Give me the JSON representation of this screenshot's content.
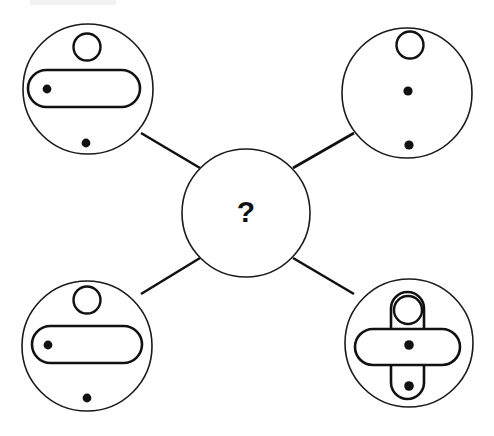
{
  "page": {
    "background_color": "#ffffff",
    "ink_color": "#111111",
    "width": 494,
    "height": 436
  },
  "center": {
    "name": "center-unknown-node",
    "label": "?",
    "cx": 246,
    "cy": 213,
    "r": 64
  },
  "connectors": [
    {
      "name": "connector-top-left",
      "x1": 141,
      "y1": 133,
      "x2": 200,
      "y2": 168
    },
    {
      "name": "connector-top-right",
      "x1": 293,
      "y1": 168,
      "x2": 354,
      "y2": 133
    },
    {
      "name": "connector-bottom-left",
      "x1": 200,
      "y1": 258,
      "x2": 141,
      "y2": 294
    },
    {
      "name": "connector-bottom-right",
      "x1": 293,
      "y1": 258,
      "x2": 354,
      "y2": 294
    }
  ],
  "nodes": [
    {
      "name": "node-top-left",
      "position": "top-left",
      "circle": {
        "cx": 88,
        "cy": 89,
        "r": 65
      },
      "shapes": [
        {
          "kind": "small-circle",
          "name": "small-circle-top",
          "cx": 87,
          "cy": 47,
          "r": 13.5
        },
        {
          "kind": "pill-horizontal",
          "name": "horizontal-pill",
          "x": 28,
          "y": 70,
          "w": 112,
          "h": 37
        },
        {
          "kind": "dot",
          "name": "dot-left-in-pill",
          "cx": 47,
          "cy": 89,
          "r": 4.4
        },
        {
          "kind": "dot",
          "name": "dot-bottom",
          "cx": 86,
          "cy": 143,
          "r": 4.4
        }
      ]
    },
    {
      "name": "node-top-right",
      "position": "top-right",
      "circle": {
        "cx": 407,
        "cy": 93,
        "r": 65
      },
      "shapes": [
        {
          "kind": "small-circle",
          "name": "small-circle-top",
          "cx": 410,
          "cy": 45,
          "r": 13.5
        },
        {
          "kind": "dot",
          "name": "dot-center",
          "cx": 408,
          "cy": 91,
          "r": 4.6
        },
        {
          "kind": "dot",
          "name": "dot-bottom",
          "cx": 409,
          "cy": 145,
          "r": 4.6
        }
      ]
    },
    {
      "name": "node-bottom-left",
      "position": "bottom-left",
      "circle": {
        "cx": 87,
        "cy": 346,
        "r": 65
      },
      "shapes": [
        {
          "kind": "small-circle",
          "name": "small-circle-top",
          "cx": 87,
          "cy": 300,
          "r": 13.5
        },
        {
          "kind": "pill-horizontal",
          "name": "horizontal-pill",
          "x": 32,
          "y": 326,
          "w": 110,
          "h": 37
        },
        {
          "kind": "dot",
          "name": "dot-left-in-pill",
          "cx": 48,
          "cy": 345,
          "r": 4.4
        },
        {
          "kind": "dot",
          "name": "dot-bottom",
          "cx": 87,
          "cy": 398,
          "r": 4.4
        }
      ]
    },
    {
      "name": "node-bottom-right",
      "position": "bottom-right",
      "circle": {
        "cx": 409,
        "cy": 343,
        "r": 64
      },
      "shapes": [
        {
          "kind": "pill-vertical",
          "name": "vertical-pill",
          "x": 391,
          "y": 292,
          "w": 33,
          "h": 107
        },
        {
          "kind": "pill-horizontal",
          "name": "horizontal-pill",
          "x": 355,
          "y": 329,
          "w": 105,
          "h": 36
        },
        {
          "kind": "small-circle",
          "name": "small-circle-top",
          "cx": 408,
          "cy": 310,
          "r": 14
        },
        {
          "kind": "dot",
          "name": "dot-center",
          "cx": 409,
          "cy": 345,
          "r": 4.8
        },
        {
          "kind": "dot",
          "name": "dot-bottom",
          "cx": 409,
          "cy": 386,
          "r": 4.8
        }
      ]
    }
  ],
  "artifacts": [
    {
      "name": "scan-smudge-top",
      "x": 30,
      "y": 0,
      "w": 86,
      "h": 5
    }
  ]
}
